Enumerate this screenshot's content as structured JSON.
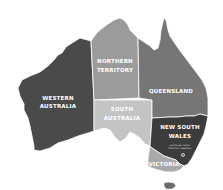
{
  "map": {
    "title": "Australia states and territories",
    "colors": {
      "western_australia": "#4a4a4a",
      "northern_territory": "#9b9b9b",
      "south_australia": "#c4c4c4",
      "queensland": "#767676",
      "new_south_wales": "#3c3c3c",
      "victoria": "#a9a9a9",
      "tasmania": "#6a6a6a",
      "border": "#ffffff"
    },
    "regions": {
      "western_australia": {
        "line1": "WESTERN",
        "line2": "AUSTRALIA"
      },
      "northern_territory": {
        "line1": "NORTHERN",
        "line2": "TERRITORY"
      },
      "south_australia": {
        "line1": "SOUTH",
        "line2": "AUSTRALIA"
      },
      "queensland": {
        "line1": "QUEENSLAND"
      },
      "new_south_wales": {
        "line1": "NEW SOUTH",
        "line2": "WALES",
        "note1": "AUSTRALIAN CAPITAL",
        "note2": "TERRITORY (CANBERRA)"
      },
      "victoria": {
        "line1": "VICTORIA"
      },
      "tasmania": {
        "line1": ""
      }
    }
  }
}
